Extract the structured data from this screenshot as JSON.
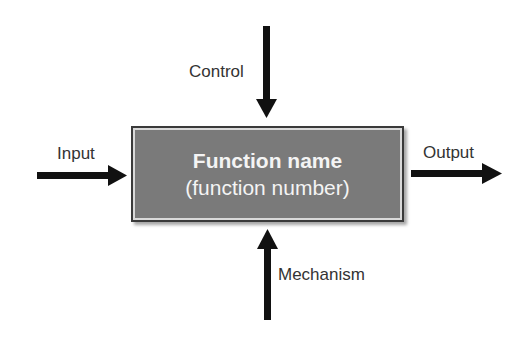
{
  "diagram": {
    "type": "IDEF0 function block",
    "box": {
      "title": "Function name",
      "subtitle": "(function number)",
      "fill": "#7a7a7a",
      "text_color": "#f4f4f4"
    },
    "arrows": {
      "input": {
        "label": "Input",
        "direction": "right"
      },
      "output": {
        "label": "Output",
        "direction": "right"
      },
      "control": {
        "label": "Control",
        "direction": "down"
      },
      "mechanism": {
        "label": "Mechanism",
        "direction": "up"
      }
    },
    "arrow_color": "#111111"
  }
}
